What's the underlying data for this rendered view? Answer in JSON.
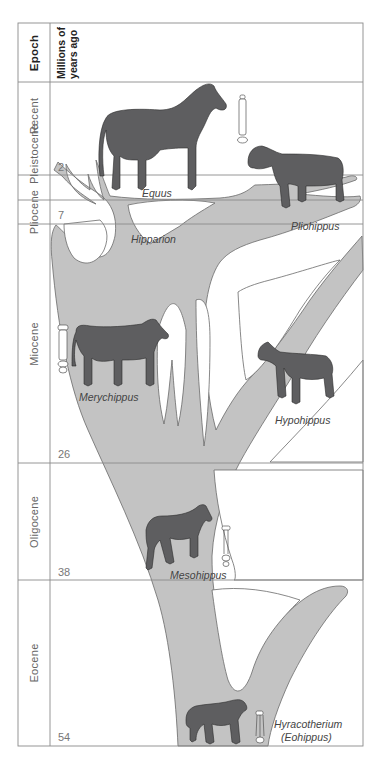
{
  "header": {
    "epoch_label": "Epoch",
    "mya_label_line1": "Millions of",
    "mya_label_line2": "years ago"
  },
  "epochs": [
    {
      "name": "Recent"
    },
    {
      "name": "Pleistocene"
    },
    {
      "name": "Pliocene"
    },
    {
      "name": "Miocene"
    },
    {
      "name": "Oligocene"
    },
    {
      "name": "Eocene"
    }
  ],
  "time_marks": [
    "2",
    "7",
    "26",
    "38",
    "54"
  ],
  "genera": [
    {
      "name": "Equus"
    },
    {
      "name": "Pliohippus"
    },
    {
      "name": "Hipparion"
    },
    {
      "name": "Merychippus"
    },
    {
      "name": "Hypohippus"
    },
    {
      "name": "Mesohippus"
    },
    {
      "name": "Hyracotherium"
    },
    {
      "name": "(Eohippus)"
    }
  ],
  "colors": {
    "tree_fill": "#c3c3c3",
    "tree_stroke": "#6a6a6a",
    "horse_fill": "#5e5e60",
    "grid_line": "#8a8a8a"
  }
}
